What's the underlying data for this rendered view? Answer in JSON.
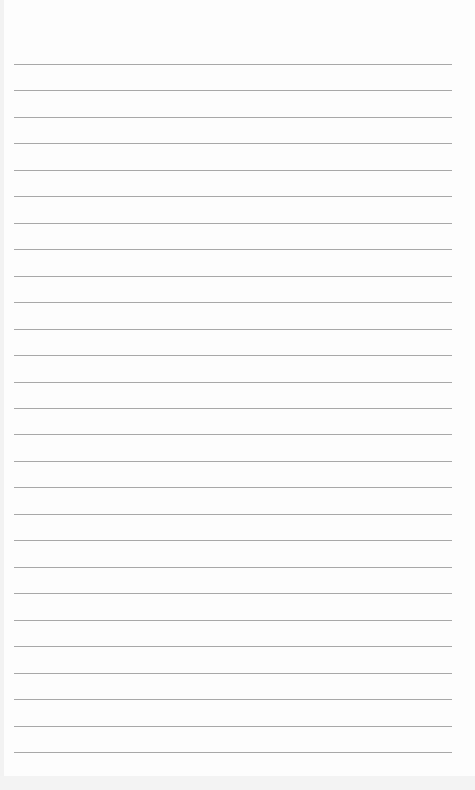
{
  "page": {
    "type": "lined-paper",
    "line_count": 27,
    "first_line_y": 64,
    "line_spacing": 26.46,
    "line_color": "#a8a8a8",
    "background_color": "#fdfdfd",
    "text": ""
  }
}
